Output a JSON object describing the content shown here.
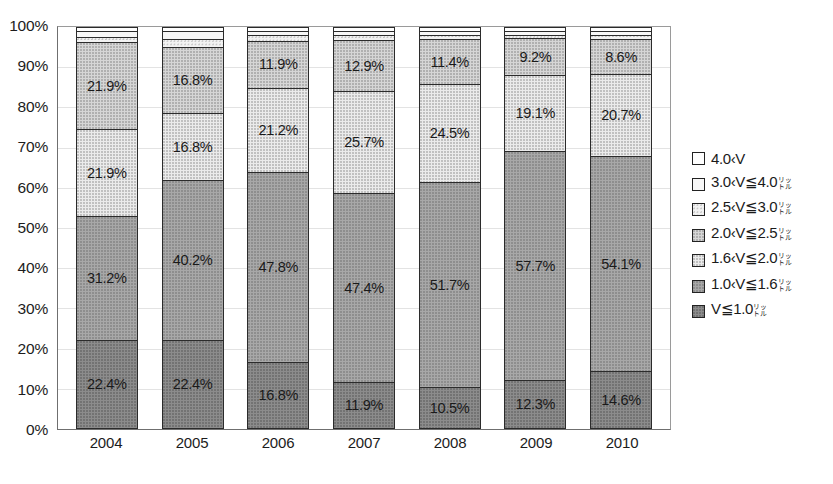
{
  "chart_data": {
    "type": "bar",
    "subtype": "100%-stacked-vertical",
    "title": "",
    "xlabel": "",
    "ylabel": "",
    "ylim": [
      0,
      100
    ],
    "yticks": [
      "0%",
      "10%",
      "20%",
      "30%",
      "40%",
      "50%",
      "60%",
      "70%",
      "80%",
      "90%",
      "100%"
    ],
    "grid": true,
    "legend_position": "right",
    "categories": [
      "2004",
      "2005",
      "2006",
      "2007",
      "2008",
      "2009",
      "2010"
    ],
    "series": [
      {
        "name": "V≦1.0",
        "legend_label": "V≦1.0",
        "legend_unit": "リットル",
        "fill": "c6",
        "stack_order": 0,
        "values": [
          22.4,
          22.4,
          16.8,
          11.9,
          10.5,
          12.3,
          14.6
        ],
        "labels": [
          "22.4%",
          "22.4%",
          "16.8%",
          "11.9%",
          "10.5%",
          "12.3%",
          "14.6%"
        ]
      },
      {
        "name": "1.0<V≦1.6",
        "legend_label": "1.0‹1.6",
        "legend_unit": "リットル",
        "fill": "c5",
        "stack_order": 1,
        "values": [
          31.2,
          40.2,
          47.8,
          47.4,
          51.7,
          57.7,
          54.1
        ],
        "labels": [
          "31.2%",
          "40.2%",
          "47.8%",
          "47.4%",
          "51.7%",
          "57.7%",
          "54.1%"
        ]
      },
      {
        "name": "1.6<V≦2.0",
        "legend_label": "1.6‹2.0",
        "legend_unit": "リットル",
        "fill": "c4",
        "stack_order": 2,
        "values": [
          21.9,
          16.8,
          21.2,
          25.7,
          24.5,
          19.1,
          20.7
        ],
        "labels": [
          "21.9%",
          "16.8%",
          "21.2%",
          "25.7%",
          "24.5%",
          "19.1%",
          "20.7%"
        ]
      },
      {
        "name": "2.0<V≦2.5",
        "legend_label": "2.0‹2.5",
        "legend_unit": "リットル",
        "fill": "c3",
        "stack_order": 3,
        "values": [
          21.9,
          16.8,
          11.9,
          12.9,
          11.4,
          9.2,
          8.6
        ],
        "labels": [
          "21.9%",
          "16.8%",
          "11.9%",
          "12.9%",
          "11.4%",
          "9.2%",
          "8.6%"
        ]
      },
      {
        "name": "2.5<V≦3.0",
        "legend_label": "2.5‹3.0",
        "legend_unit": "リットル",
        "fill": "c2",
        "stack_order": 4,
        "values": [
          1.3,
          1.9,
          1.3,
          1.1,
          1.0,
          0.9,
          1.1
        ],
        "labels": [
          "",
          "",
          "",
          "",
          "",
          "",
          ""
        ]
      },
      {
        "name": "3.0<V≦4.0",
        "legend_label": "3.0‹4.0",
        "legend_unit": "リットル",
        "fill": "c1",
        "stack_order": 5,
        "values": [
          1.3,
          1.9,
          1.0,
          1.0,
          0.9,
          0.8,
          0.9
        ],
        "labels": [
          "",
          "",
          "",
          "",
          "",
          "",
          ""
        ]
      },
      {
        "name": "4.0<V",
        "legend_label": "4.0‹V",
        "legend_unit": "",
        "fill": "c0",
        "stack_order": 6,
        "values": [
          0.0,
          0.0,
          0.0,
          0.0,
          0.0,
          0.0,
          0.0
        ],
        "labels": [
          "",
          "",
          "",
          "",
          "",
          "",
          ""
        ]
      }
    ]
  },
  "legend": {
    "items": [
      {
        "label": "4.0‹V",
        "unit_top": "",
        "unit_bottom": "",
        "fill": "c0"
      },
      {
        "label": "3.0‹V≦4.0",
        "unit_top": "リッ",
        "unit_bottom": "トル",
        "fill": "c1"
      },
      {
        "label": "2.5‹V≦3.0",
        "unit_top": "リッ",
        "unit_bottom": "トル",
        "fill": "c2"
      },
      {
        "label": "2.0‹V≦2.5",
        "unit_top": "リッ",
        "unit_bottom": "トル",
        "fill": "c3"
      },
      {
        "label": "1.6‹V≦2.0",
        "unit_top": "リッ",
        "unit_bottom": "トル",
        "fill": "c4"
      },
      {
        "label": "1.0‹V≦1.6",
        "unit_top": "リッ",
        "unit_bottom": "トル",
        "fill": "c5"
      },
      {
        "label": "V≦1.0",
        "unit_top": "リッ",
        "unit_bottom": "トル",
        "fill": "c6"
      }
    ]
  }
}
